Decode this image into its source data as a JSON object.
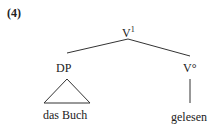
{
  "example_number": "(4)",
  "tree": {
    "root": {
      "label": "V",
      "superscript": "1"
    },
    "left": {
      "label": "DP",
      "terminal": "das Buch",
      "terminal_style": "triangle"
    },
    "right": {
      "label": "V°",
      "terminal": "gelesen",
      "terminal_style": "line"
    }
  }
}
